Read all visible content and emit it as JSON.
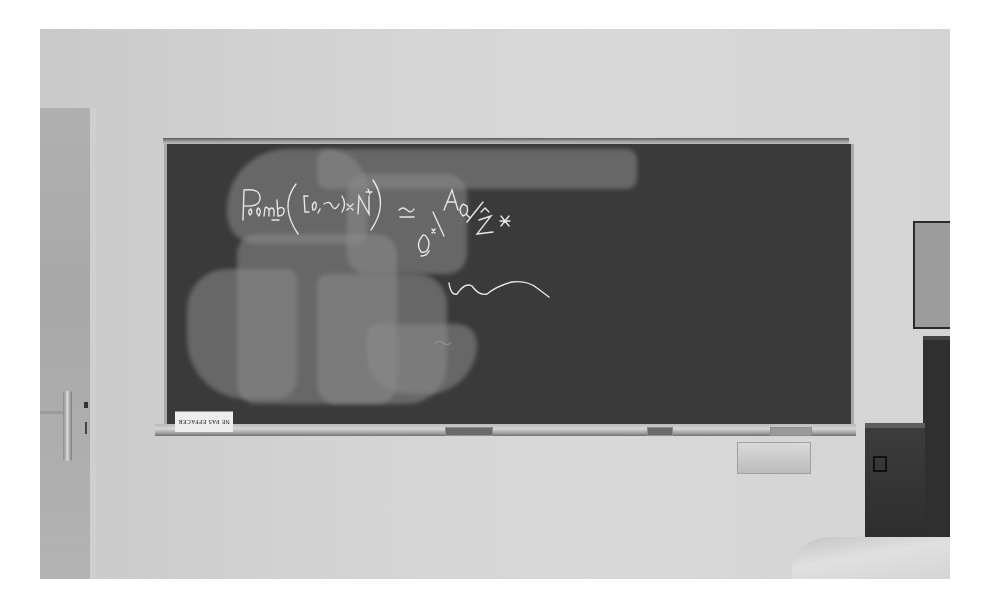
{
  "scene": {
    "description": "Grayscale photograph of a classroom wall with a chalkboard, partially erased",
    "palette": {
      "wall": "#d4d4d4",
      "board": "#3a3a3a",
      "chalk": "#e6e6e6",
      "door": "#acacac",
      "cabinet": "#2f2f2f",
      "frame_background": "#ffffff"
    }
  },
  "chalkboard": {
    "equation": "P_comb([0,∞)×N*) ≃ Q^× \\ A_Q / Ẑ^×",
    "equation_parts": [
      "P",
      "comb",
      "([0,∞)×N*)",
      "≃",
      "Q×",
      "\\",
      "A",
      "Q",
      "/",
      "Ẑ",
      "×"
    ],
    "squiggle": "wavy chalk line"
  },
  "ledge": {
    "sign_text": "NE PAS EFFACER"
  }
}
